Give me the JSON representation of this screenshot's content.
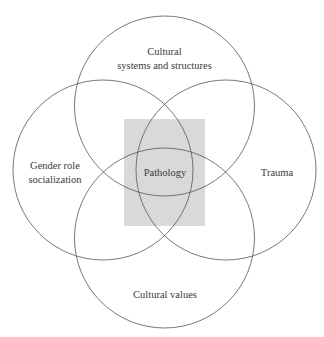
{
  "diagram": {
    "type": "venn",
    "center": {
      "label": "Pathology",
      "highlight_color": "#d9d9d9"
    },
    "sets": [
      {
        "id": "top",
        "lines": [
          "Cultural",
          "systems and structures"
        ]
      },
      {
        "id": "left",
        "lines": [
          "Gender role",
          "socialization"
        ]
      },
      {
        "id": "right",
        "lines": [
          "Trauma"
        ]
      },
      {
        "id": "bottom",
        "lines": [
          "Cultural values"
        ]
      }
    ],
    "stroke_color": "#555555",
    "text_color": "#3a3a3a"
  }
}
